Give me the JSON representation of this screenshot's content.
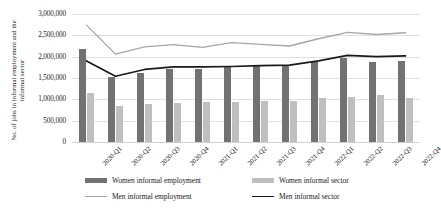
{
  "chart_data": {
    "type": "bar",
    "title": "",
    "xlabel": "",
    "ylabel": "No. of jobs in informal employment and the informal sector",
    "ylim": [
      0,
      3000000
    ],
    "ytick_values": [
      0,
      500000,
      1000000,
      1500000,
      2000000,
      2500000,
      3000000
    ],
    "ytick_labels": [
      "0",
      "500,000",
      "1,000,000",
      "1,500,000",
      "2,000,000",
      "2,500,000",
      "3,000,000"
    ],
    "grid": true,
    "legend_position": "bottom",
    "categories": [
      "2020-Q1",
      "2020-Q2",
      "2020-Q3",
      "2020-Q4",
      "2021-Q1",
      "2021-Q2",
      "2021-Q3",
      "2021-Q4",
      "2022-Q1",
      "2022-Q2",
      "2022-Q3",
      "2022-Q4"
    ],
    "series": [
      {
        "name": "Women informal employment",
        "kind": "bar",
        "color": "#767171",
        "values": [
          2180000,
          1530000,
          1620000,
          1700000,
          1700000,
          1760000,
          1800000,
          1800000,
          1890000,
          1960000,
          1870000,
          1900000
        ]
      },
      {
        "name": "Women informal sector",
        "kind": "bar",
        "color": "#bfbfbf",
        "values": [
          1160000,
          840000,
          880000,
          920000,
          930000,
          930000,
          950000,
          970000,
          1020000,
          1060000,
          1100000,
          1040000
        ]
      },
      {
        "name": "Men informal employment",
        "kind": "line",
        "color": "#a6a6a6",
        "values": [
          2740000,
          2060000,
          2230000,
          2280000,
          2220000,
          2330000,
          2290000,
          2250000,
          2420000,
          2570000,
          2520000,
          2560000
        ]
      },
      {
        "name": "Men informal sector",
        "kind": "line",
        "color": "#1a1a1a",
        "values": [
          1900000,
          1540000,
          1700000,
          1760000,
          1760000,
          1770000,
          1790000,
          1800000,
          1900000,
          2030000,
          2000000,
          2020000
        ]
      }
    ]
  },
  "legend": {
    "items": [
      {
        "label": "Women informal employment",
        "marker": "bar",
        "color": "#767171"
      },
      {
        "label": "Women informal sector",
        "marker": "bar",
        "color": "#bfbfbf"
      },
      {
        "label": "Men informal employment",
        "marker": "line",
        "color": "#a6a6a6"
      },
      {
        "label": "Men informal sector",
        "marker": "line",
        "color": "#1a1a1a"
      }
    ]
  }
}
